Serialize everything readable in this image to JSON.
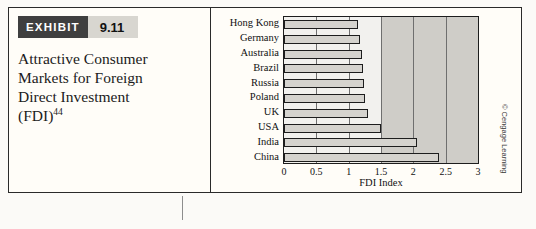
{
  "exhibit": {
    "label": "EXHIBIT",
    "number": "9.11",
    "title_line1": "Attractive Consumer",
    "title_line2": "Markets for Foreign",
    "title_line3": "Direct Investment",
    "title_line4": "(FDI)",
    "title_footnote": "44"
  },
  "credit": "© Cengage Learning",
  "colors": {
    "bar_fill": "#d5d3ce",
    "bar_stroke": "#1d1d1d",
    "band_shade": "#cfcdc8",
    "exhibit_label_bg": "#3f3f3f",
    "exhibit_number_bg": "#d8d6d0"
  },
  "chart_data": {
    "type": "bar",
    "orientation": "horizontal",
    "title": "",
    "xlabel": "FDI Index",
    "ylabel": "",
    "xlim": [
      0,
      3
    ],
    "xticks": [
      "0",
      "0.5",
      "1",
      "1.5",
      "2",
      "2.5",
      "3"
    ],
    "xtick_values": [
      0,
      0.5,
      1,
      1.5,
      2,
      2.5,
      3
    ],
    "grid": true,
    "legend": "none",
    "categories": [
      "Hong Kong",
      "Germany",
      "Australia",
      "Brazil",
      "Russia",
      "Poland",
      "UK",
      "USA",
      "India",
      "China"
    ],
    "values": [
      1.15,
      1.17,
      1.2,
      1.22,
      1.24,
      1.26,
      1.3,
      1.5,
      2.05,
      2.4
    ]
  }
}
